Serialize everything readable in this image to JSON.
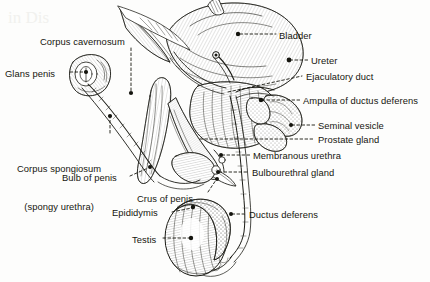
{
  "figure": {
    "background_color": "#fdfdfc",
    "ink_color": "#1a1a14",
    "label_color": "#16160f"
  },
  "labels": [
    {
      "id": "corpus-cavernosum",
      "text": "Corpus cavernosum",
      "x": 40,
      "y": 36,
      "side": "left"
    },
    {
      "id": "glans-penis",
      "text": "Glans penis",
      "x": 5,
      "y": 68,
      "side": "left"
    },
    {
      "id": "corpus-spongiosum-line1",
      "text": "Corpus spongiosum",
      "x": 17,
      "y": 138,
      "side": "left"
    },
    {
      "id": "corpus-spongiosum-line2",
      "text": "(spongy urethra)",
      "x": 26,
      "y": 150,
      "side": "left"
    },
    {
      "id": "bulb-of-penis",
      "text": "Bulb of penis",
      "x": 62,
      "y": 172,
      "side": "left"
    },
    {
      "id": "crus-of-penis",
      "text": "Crus of penis",
      "x": 137,
      "y": 193,
      "side": "left"
    },
    {
      "id": "epididymis",
      "text": "Epididymis",
      "x": 112,
      "y": 207,
      "side": "left"
    },
    {
      "id": "testis",
      "text": "Testis",
      "x": 132,
      "y": 234,
      "side": "left"
    },
    {
      "id": "bladder",
      "text": "Bladder",
      "x": 279,
      "y": 30,
      "side": "right"
    },
    {
      "id": "ureter",
      "text": "Ureter",
      "x": 311,
      "y": 57,
      "side": "right"
    },
    {
      "id": "ejaculatory-duct",
      "text": "Ejaculatory duct",
      "x": 306,
      "y": 73,
      "side": "right"
    },
    {
      "id": "ampulla-of-ductus-deferens",
      "text": "Ampulla of ductus deferens",
      "x": 303,
      "y": 97,
      "side": "right"
    },
    {
      "id": "seminal-vesicle",
      "text": "Seminal vesicle",
      "x": 318,
      "y": 121,
      "side": "right"
    },
    {
      "id": "prostate-gland",
      "text": "Prostate gland",
      "x": 318,
      "y": 135,
      "side": "right"
    },
    {
      "id": "membranous-urethra",
      "text": "Membranous urethra",
      "x": 253,
      "y": 150,
      "side": "right"
    },
    {
      "id": "bulbourethral-gland",
      "text": "Bulbourethral gland",
      "x": 252,
      "y": 167,
      "side": "right"
    },
    {
      "id": "ductus-deferens",
      "text": "Ductus deferens",
      "x": 249,
      "y": 209,
      "side": "right"
    }
  ],
  "scan_artifacts": {
    "top_bleed_text": "in Dis",
    "bottom_bleed_text": ""
  }
}
